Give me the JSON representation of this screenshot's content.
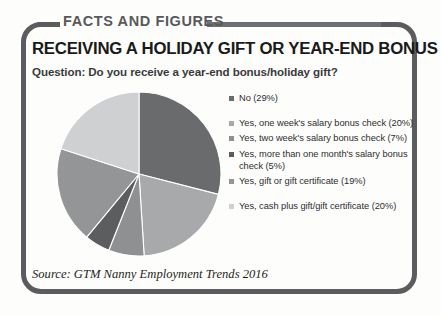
{
  "frame": {
    "kicker": "FACTS AND FIGURES",
    "headline": "RECEIVING A HOLIDAY GIFT OR YEAR-END BONUS",
    "question": "Question: Do you receive a year-end bonus/holiday gift?",
    "source": "Source: GTM Nanny Employment Trends 2016",
    "border_color": "#5b5c5e",
    "rule_color": "#6e6f71"
  },
  "chart_data": {
    "type": "pie",
    "title": "RECEIVING A HOLIDAY GIFT OR YEAR-END BONUS",
    "subtitle": "Question: Do you receive a year-end bonus/holiday gift?",
    "legend_position": "right",
    "start_angle": 0,
    "direction": "clockwise",
    "categories": [
      "No (29%)",
      "Yes, one week's salary bonus check (20%)",
      "Yes, two week's salary bonus check (7%)",
      "Yes, more than one month's salary bonus check (5%)",
      "Yes, gift or gift certificate (19%)",
      "Yes, cash plus gift/gift certificate (20%)"
    ],
    "values": [
      29,
      20,
      7,
      5,
      19,
      20
    ],
    "colors": [
      "#6a6b6d",
      "#a8a9ab",
      "#8e9092",
      "#5c5d5f",
      "#949597",
      "#cfd0d1"
    ],
    "slices": [
      {
        "label": "No (29%)",
        "value": 29,
        "color": "#6a6b6d"
      },
      {
        "label": "Yes, one week's salary bonus check (20%)",
        "value": 20,
        "color": "#a8a9ab"
      },
      {
        "label": "Yes, two week's salary bonus check (7%)",
        "value": 7,
        "color": "#8e9092"
      },
      {
        "label": "Yes, more than one month's salary bonus check (5%)",
        "value": 5,
        "color": "#5c5d5f"
      },
      {
        "label": "Yes, gift or gift certificate (19%)",
        "value": 19,
        "color": "#949597"
      },
      {
        "label": "Yes, cash plus gift/gift certificate (20%)",
        "value": 20,
        "color": "#cfd0d1"
      }
    ]
  },
  "legend": {
    "items": [
      {
        "label": "No (29%)",
        "color": "#6a6b6d",
        "spacer_below": true
      },
      {
        "label": "Yes, one week's salary bonus check (20%)",
        "color": "#a8a9ab",
        "spacer_below": false
      },
      {
        "label": "Yes, two week's salary bonus check (7%)",
        "color": "#8e9092",
        "spacer_below": false
      },
      {
        "label": "Yes, more than one month's salary bonus check (5%)",
        "color": "#5c5d5f",
        "spacer_below": false
      },
      {
        "label": "Yes, gift or gift certificate (19%)",
        "color": "#949597",
        "spacer_below": true
      },
      {
        "label": "Yes, cash plus gift/gift certificate (20%)",
        "color": "#cfd0d1",
        "spacer_below": false
      }
    ]
  }
}
